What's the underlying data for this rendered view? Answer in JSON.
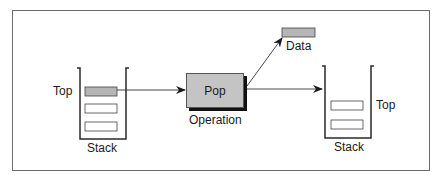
{
  "diagram": {
    "type": "stack-pop-operation",
    "left_stack": {
      "label": "Stack",
      "top_label": "Top",
      "items": [
        {
          "fill": "#b5b5b5",
          "is_top": true
        },
        {
          "fill": "#ffffff",
          "is_top": false
        },
        {
          "fill": "#ffffff",
          "is_top": false
        }
      ]
    },
    "operation": {
      "box_label": "Pop",
      "caption": "Operation",
      "fill": "#c4c4c4"
    },
    "output": {
      "label": "Data",
      "fill": "#b5b5b5"
    },
    "right_stack": {
      "label": "Stack",
      "top_label": "Top",
      "items": [
        {
          "fill": "#ffffff",
          "is_top": true
        },
        {
          "fill": "#ffffff",
          "is_top": false
        }
      ]
    },
    "colors": {
      "line": "#333333",
      "frame": "#6b6b6b",
      "shadow": "#111111"
    }
  }
}
